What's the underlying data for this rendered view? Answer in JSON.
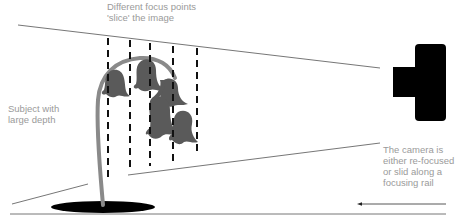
{
  "diagram": {
    "labels": {
      "focus_points": [
        "Different focus points",
        "'slice' the image"
      ],
      "subject": [
        "Subject with",
        "large depth"
      ],
      "camera": [
        "The camera is",
        "either re-focused",
        "or slid along a",
        "focusing rail"
      ]
    },
    "elements": {
      "subject": "bluebell-flower-icon",
      "camera": "camera-icon",
      "focus_slices": 5,
      "arrow_direction": "left"
    },
    "colors": {
      "label_text": "#9a9a9a",
      "lines": "#555555",
      "dashes": "#111111",
      "flower": "#5a5a5a",
      "stem": "#8a8a8a",
      "camera": "#000000",
      "shadow": "#000000"
    }
  }
}
